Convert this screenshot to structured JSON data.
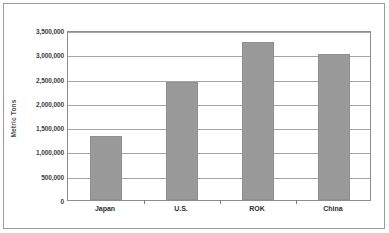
{
  "chart_data": {
    "type": "bar",
    "title": "",
    "subtitle": "",
    "xlabel": "",
    "ylabel": "Metric Tons",
    "categories": [
      "Japan",
      "U.S.",
      "ROK",
      "China"
    ],
    "values": [
      1320000,
      2420000,
      3250000,
      3010000
    ],
    "series": [
      {
        "name": "Metric Tons",
        "values": [
          1320000,
          2420000,
          3250000,
          3010000
        ]
      }
    ],
    "ylim": [
      0,
      3500000
    ],
    "ytick_step": 500000,
    "ytick_labels": [
      "3,500,000",
      "3,000,000",
      "2,500,000",
      "2,000,000",
      "1,500,000",
      "1,000,000",
      "500,000",
      "0"
    ],
    "ytick_values": [
      3500000,
      3000000,
      2500000,
      2000000,
      1500000,
      1000000,
      500000,
      0
    ],
    "grid": true,
    "grid_axis": "y",
    "legend": false,
    "legend_position": "none",
    "bar_color": "#999999",
    "grid_color": "#a6a6a6",
    "plot_border_color": "#8c8c8c",
    "frame_color": "#9a9a9a",
    "background_color": "#ffffff",
    "annotations": []
  }
}
